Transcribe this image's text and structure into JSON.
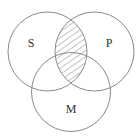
{
  "diagram": {
    "type": "venn",
    "sets": [
      {
        "label": "S",
        "cx": 47.5,
        "cy": 51.5,
        "r": 39.5
      },
      {
        "label": "P",
        "cx": 94.5,
        "cy": 51.5,
        "r": 39.5
      },
      {
        "label": "M",
        "cx": 71,
        "cy": 92,
        "r": 39.5
      }
    ],
    "shaded_region": "S ∩ P",
    "shading_style": "diagonal-hatch",
    "colors": {
      "stroke": "#8a8a8a",
      "hatch": "#7a7a7a",
      "label": "#333333",
      "background": "#ffffff"
    }
  }
}
